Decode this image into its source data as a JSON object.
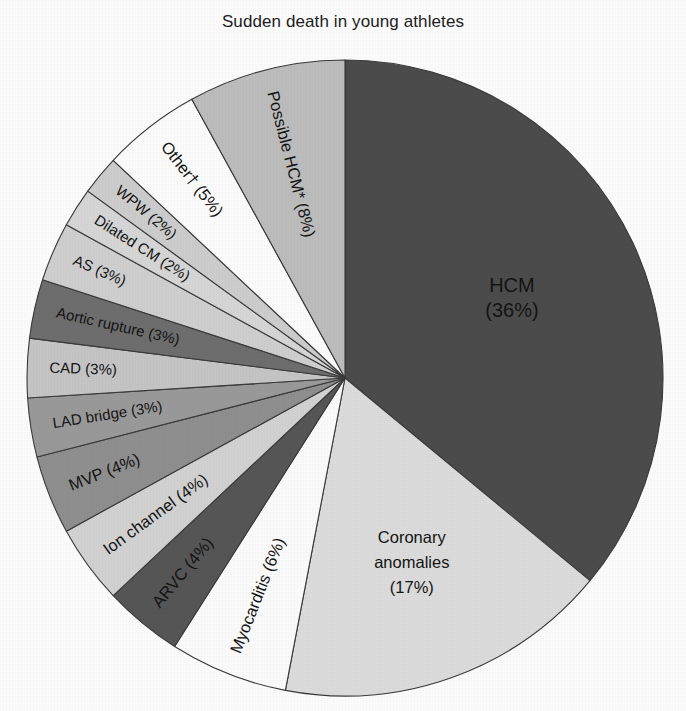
{
  "chart_data": {
    "type": "pie",
    "title": "Sudden death in young athletes",
    "xlabel": "",
    "ylabel": "",
    "legend_position": "none",
    "grid": false,
    "labels_inside": true,
    "categories": [
      "HCM",
      "Coronary anomalies",
      "Myocarditis",
      "ARVC",
      "Ion channel",
      "MVP",
      "LAD bridge",
      "CAD",
      "Aortic rupture",
      "AS",
      "Dilated CM",
      "WPW",
      "Other†",
      "Possible HCM*"
    ],
    "values": [
      36,
      17,
      6,
      4,
      4,
      4,
      3,
      3,
      3,
      3,
      2,
      2,
      5,
      8
    ],
    "value_unit": "%",
    "slices": [
      {
        "label": "HCM",
        "value": 36,
        "display": "HCM\n(36%)",
        "line1": "HCM",
        "line2": "(36%)",
        "color": "#4c4c4c",
        "text_color": "#f2f2f2",
        "text_style": "big"
      },
      {
        "label": "Coronary anomalies",
        "value": 17,
        "display": "Coronary anomalies (17%)",
        "line1": "Coronary",
        "line2": "anomalies",
        "line3": "(17%)",
        "color": "#dcdcdc",
        "text_color": "#141414",
        "text_style": "normal"
      },
      {
        "label": "Myocarditis",
        "value": 6,
        "display": "Myocarditis (6%)",
        "color": "#fbfbfb",
        "text_color": "#141414",
        "text_style": "normal"
      },
      {
        "label": "ARVC",
        "value": 4,
        "display": "ARVC (4%)",
        "color": "#565656",
        "text_color": "#141414",
        "text_style": "normal"
      },
      {
        "label": "Ion channel",
        "value": 4,
        "display": "Ion channel (4%)",
        "color": "#d2d2d2",
        "text_color": "#141414",
        "text_style": "normal"
      },
      {
        "label": "MVP",
        "value": 4,
        "display": "MVP (4%)",
        "color": "#8f8f8f",
        "text_color": "#141414",
        "text_style": "normal"
      },
      {
        "label": "LAD bridge",
        "value": 3,
        "display": "LAD bridge (3%)",
        "color": "#9a9a9a",
        "text_color": "#141414",
        "text_style": "normal"
      },
      {
        "label": "CAD",
        "value": 3,
        "display": "CAD (3%)",
        "color": "#c5c5c5",
        "text_color": "#141414",
        "text_style": "normal"
      },
      {
        "label": "Aortic rupture",
        "value": 3,
        "display": "Aortic rupture (3%)",
        "color": "#6e6e6e",
        "text_color": "#141414",
        "text_style": "normal"
      },
      {
        "label": "AS",
        "value": 3,
        "display": "AS (3%)",
        "color": "#cfcfcf",
        "text_color": "#141414",
        "text_style": "normal"
      },
      {
        "label": "Dilated CM",
        "value": 2,
        "display": "Dilated CM (2%)",
        "color": "#d6d6d6",
        "text_color": "#141414",
        "text_style": "normal"
      },
      {
        "label": "WPW",
        "value": 2,
        "display": "WPW (2%)",
        "color": "#cdcdcd",
        "text_color": "#141414",
        "text_style": "normal"
      },
      {
        "label": "Other†",
        "value": 5,
        "display": "Other† (5%)",
        "color": "#fcfcfc",
        "text_color": "#141414",
        "text_style": "normal"
      },
      {
        "label": "Possible HCM*",
        "value": 8,
        "display": "Possible HCM* (8%)",
        "color": "#bdbdbd",
        "text_color": "#141414",
        "text_style": "normal"
      }
    ]
  },
  "figure": {
    "title": "Sudden death in young athletes",
    "center_x": 345,
    "center_y": 378,
    "radius": 318,
    "start_angle_deg": 0,
    "direction": "clockwise",
    "background_color": "#fcfcfc",
    "outline_color": "#3a3a3a"
  }
}
